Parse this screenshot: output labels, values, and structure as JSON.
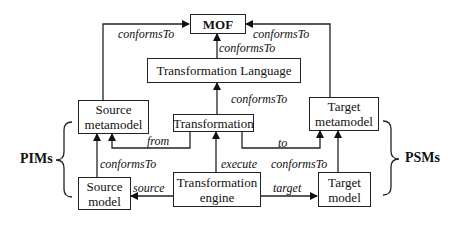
{
  "diagram": {
    "nodes": {
      "mof": "MOF",
      "transformation_language": "Transformation Language",
      "source_metamodel": "Source metamodel",
      "transformation": "Transformation",
      "target_metamodel": "Target metamodel",
      "source_model": "Source model",
      "transformation_engine": "Transformation engine",
      "target_model": "Target model"
    },
    "edges": {
      "srcmm_to_mof": "conformsTo",
      "tgtmm_to_mof": "conformsTo",
      "tl_to_mof": "conformsTo",
      "trans_to_tl": "conformsTo",
      "from": "from",
      "to": "to",
      "srcmodel_to_srcmm": "conformsTo",
      "execute": "execute",
      "tgtmodel_to_tgtmm": "conformsTo",
      "source": "source",
      "target": "target"
    },
    "groups": {
      "pims": "PIMs",
      "psms": "PSMs"
    }
  }
}
